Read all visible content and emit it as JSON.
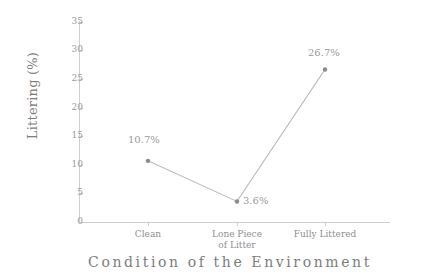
{
  "chart_data": {
    "type": "line",
    "title": "",
    "xlabel": "Condition of the Environment",
    "ylabel": "Littering (%)",
    "categories": [
      "Clean",
      "Lone Piece of Litter",
      "Fully Littered"
    ],
    "values": [
      10.7,
      3.6,
      26.7
    ],
    "point_labels": [
      "10.7%",
      "3.6%",
      "26.7%"
    ],
    "ylim": [
      0,
      35
    ],
    "yticks": [
      0,
      5,
      10,
      15,
      20,
      25,
      30,
      35
    ],
    "ytick_labels": [
      "0",
      "5",
      "10",
      "15",
      "20",
      "25",
      "30",
      "35"
    ],
    "grid": false,
    "legend": "none",
    "series": [
      {
        "name": "Littering",
        "values": [
          10.7,
          3.6,
          26.7
        ]
      }
    ]
  },
  "axes": {
    "y_title": "Littering (%)",
    "x_title": "Condition of the Environment"
  },
  "xtick_labels": [
    {
      "line1": "Clean",
      "line2": ""
    },
    {
      "line1": "Lone Piece",
      "line2": "of Litter"
    },
    {
      "line1": "Fully Littered",
      "line2": ""
    }
  ],
  "ytick_labels": [
    "35",
    "30",
    "25",
    "20",
    "15",
    "10",
    "5",
    "0"
  ],
  "point_labels": [
    "10.7%",
    "3.6%",
    "26.7%"
  ],
  "colors": {
    "line": "#bdbdbd",
    "marker": "#8a8a8a",
    "axis": "#cfcfcf",
    "tick_text": "#9a9a9a",
    "title_text": "#7d7d7d",
    "background": "#ffffff"
  }
}
